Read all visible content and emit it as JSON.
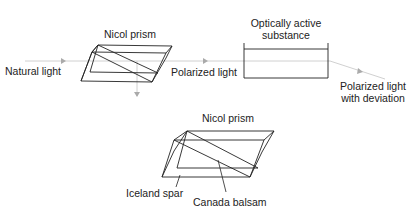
{
  "diagram": {
    "top": {
      "natural_light_label": "Natural light",
      "nicol_prism_label": "Nicol prism",
      "polarized_light_label": "Polarized light",
      "substance_label_line1": "Optically active",
      "substance_label_line2": "substance",
      "output_label_line1": "Polarized light",
      "output_label_line2": "with deviation"
    },
    "bottom": {
      "nicol_prism_label": "Nicol prism",
      "iceland_spar_label": "Iceland spar",
      "canada_balsam_label": "Canada balsam"
    },
    "colors": {
      "line": "#222222",
      "beam": "#bbbbbb",
      "beam_arrow": "#aaaaaa"
    }
  }
}
